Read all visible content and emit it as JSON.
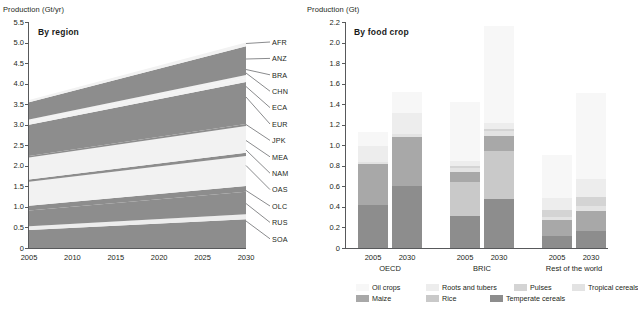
{
  "chart_data": [
    {
      "type": "area",
      "title": "By region",
      "ylabel": "Production (Gt/yr)",
      "xlabel": "",
      "x": [
        2005,
        2030
      ],
      "ylim": [
        0,
        5.5
      ],
      "xlim": [
        2005,
        2030
      ],
      "yticks": [
        "0",
        "0.5",
        "1.0",
        "1.5",
        "2.0",
        "2.5",
        "3.0",
        "3.5",
        "4.0",
        "4.5",
        "5.0",
        "5.5"
      ],
      "xticks": [
        "2005",
        "2010",
        "2015",
        "2020",
        "2025",
        "2030"
      ],
      "grid": false,
      "legend_position": "right-labels",
      "stack_order_bottom_to_top": [
        "SOA",
        "RUS",
        "OLC",
        "OAS",
        "NAM",
        "MEA",
        "JPK",
        "EUR",
        "ECA",
        "CHN",
        "BRA",
        "ANZ",
        "AFR"
      ],
      "series": [
        {
          "name": "SOA",
          "label": "SOA",
          "values_2005": 0.44,
          "values_2030": 0.7,
          "color": "#8d8d8d"
        },
        {
          "name": "RUS",
          "label": "RUS",
          "values_2005": 0.09,
          "values_2030": 0.12,
          "color": "#ededed"
        },
        {
          "name": "OLC",
          "label": "OLC",
          "values_2005": 0.38,
          "values_2030": 0.55,
          "color": "#8d8d8d"
        },
        {
          "name": "OAS",
          "label": "OAS",
          "values_2005": 0.12,
          "values_2030": 0.14,
          "color": "#8d8d8d"
        },
        {
          "name": "NAM",
          "label": "NAM",
          "values_2005": 0.58,
          "values_2030": 0.73,
          "color": "#f2f2f2"
        },
        {
          "name": "MEA",
          "label": "MEA",
          "values_2005": 0.06,
          "values_2030": 0.08,
          "color": "#8d8d8d"
        },
        {
          "name": "JPK",
          "label": "JPK",
          "values_2005": 0.53,
          "values_2030": 0.65,
          "color": "#f2f2f2"
        },
        {
          "name": "EUR",
          "label": "EUR",
          "values_2005": 0.04,
          "values_2030": 0.05,
          "color": "#8d8d8d"
        },
        {
          "name": "ECA",
          "label": "ECA",
          "values_2005": 0.76,
          "values_2030": 1.02,
          "color": "#8d8d8d"
        },
        {
          "name": "CHN",
          "label": "CHN",
          "values_2005": 0.08,
          "values_2030": 0.1,
          "color": "#f2f2f2"
        },
        {
          "name": "BRA",
          "label": "BRA",
          "values_2005": 0.05,
          "values_2030": 0.07,
          "color": "#f2f2f2"
        },
        {
          "name": "ANZ",
          "label": "ANZ",
          "values_2005": 0.42,
          "values_2030": 0.7,
          "color": "#8d8d8d"
        },
        {
          "name": "AFR",
          "label": "AFR",
          "values_2005": 0.05,
          "values_2030": 0.09,
          "color": "#f2f2f2"
        }
      ],
      "region_labels": [
        "AFR",
        "ANZ",
        "BRA",
        "CHN",
        "ECA",
        "EUR",
        "JPK",
        "MEA",
        "NAM",
        "OAS",
        "OLC",
        "RUS",
        "SOA"
      ],
      "total_2005": 3.5,
      "total_2030": 5.12
    },
    {
      "type": "bar",
      "title": "By food crop",
      "ylabel": "Production (Gt)",
      "xlabel": "",
      "ylim": [
        0,
        2.2
      ],
      "yticks": [
        "0",
        "0.2",
        "0.4",
        "0.6",
        "0.8",
        "1.0",
        "1.2",
        "1.4",
        "1.6",
        "1.8",
        "2.0",
        "2.2"
      ],
      "grid": false,
      "stacked": true,
      "groups": [
        {
          "name": "OECD",
          "bars": [
            "2005",
            "2030"
          ]
        },
        {
          "name": "BRIC",
          "bars": [
            "2005",
            "2030"
          ]
        },
        {
          "name": "Rest of the world",
          "bars": [
            "2005",
            "2030"
          ]
        }
      ],
      "categories": [
        "OECD 2005",
        "OECD 2030",
        "BRIC 2005",
        "BRIC 2030",
        "Rest of the world 2005",
        "Rest of the world 2030"
      ],
      "series": [
        {
          "name": "Temperate cereals",
          "color": "#8d8d8d",
          "values": [
            0.42,
            0.6,
            0.31,
            0.48,
            0.12,
            0.17
          ]
        },
        {
          "name": "Rice",
          "color": "#c9c9c9",
          "values": [
            0.0,
            0.0,
            0.33,
            0.46,
            0.0,
            0.0
          ]
        },
        {
          "name": "Maize",
          "color": "#a8a8a8",
          "values": [
            0.4,
            0.48,
            0.1,
            0.15,
            0.15,
            0.19
          ]
        },
        {
          "name": "Tropical cereals",
          "color": "#e3e3e3",
          "values": [
            0.02,
            0.03,
            0.04,
            0.05,
            0.03,
            0.05
          ]
        },
        {
          "name": "Pulses",
          "color": "#d4d4d4",
          "values": [
            0.0,
            0.0,
            0.02,
            0.02,
            0.07,
            0.09
          ]
        },
        {
          "name": "Roots and tubers",
          "color": "#ededed",
          "values": [
            0.15,
            0.2,
            0.05,
            0.06,
            0.12,
            0.17
          ]
        },
        {
          "name": "Oil crops",
          "color": "#f7f7f7",
          "values": [
            0.14,
            0.21,
            0.57,
            0.94,
            0.42,
            0.84
          ]
        }
      ],
      "bar_totals": [
        1.13,
        1.52,
        1.42,
        2.1,
        0.91,
        1.51
      ],
      "xticks": [
        "2005",
        "2030",
        "2005",
        "2030",
        "2005",
        "2030"
      ]
    }
  ],
  "left_chart": {
    "ylabel": "Production (Gt/yr)",
    "panel_title": "By region",
    "yticks": [
      "5.5",
      "5.0",
      "4.5",
      "4.0",
      "3.5",
      "3.0",
      "2.5",
      "2.0",
      "1.5",
      "1.0",
      "0.5",
      "0"
    ],
    "xticks": [
      "2005",
      "2010",
      "2015",
      "2020",
      "2025",
      "2030"
    ],
    "region_labels": [
      "AFR",
      "ANZ",
      "BRA",
      "CHN",
      "ECA",
      "EUR",
      "JPK",
      "MEA",
      "NAM",
      "OAS",
      "OLC",
      "RUS",
      "SOA"
    ]
  },
  "right_chart": {
    "ylabel": "Production (Gt)",
    "panel_title": "By food crop",
    "yticks": [
      "2.2",
      "2.0",
      "1.8",
      "1.6",
      "1.4",
      "1.2",
      "1.0",
      "0.8",
      "0.6",
      "0.4",
      "0.2",
      "0"
    ],
    "xticks": [
      "2005",
      "2030",
      "2005",
      "2030",
      "2005",
      "2030"
    ],
    "groups": [
      "OECD",
      "BRIC",
      "Rest of the world"
    ]
  },
  "legend": {
    "row1": [
      {
        "label": "Oil crops",
        "color": "#f7f7f7"
      },
      {
        "label": "Roots and tubers",
        "color": "#ededed"
      },
      {
        "label": "Pulses",
        "color": "#d4d4d4"
      },
      {
        "label": "Tropical cereals",
        "color": "#e3e3e3"
      }
    ],
    "row2": [
      {
        "label": "Maize",
        "color": "#a8a8a8"
      },
      {
        "label": "Rice",
        "color": "#c9c9c9"
      },
      {
        "label": "Temperate cereals",
        "color": "#8d8d8d"
      }
    ]
  }
}
